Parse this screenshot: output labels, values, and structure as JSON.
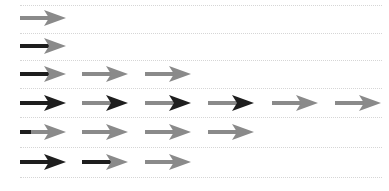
{
  "colors": {
    "dark": "#1e1e1e",
    "gray": "#8a8a8a",
    "rule": "#d6d6d6",
    "background": "#ffffff"
  },
  "rules_y": [
    5,
    33,
    60,
    88,
    117,
    147,
    177
  ],
  "column_x": [
    20,
    82,
    145,
    208,
    272,
    335
  ],
  "rows": [
    {
      "y": 18,
      "arrows": [
        {
          "shaft": "gray",
          "head": "gray"
        }
      ]
    },
    {
      "y": 46,
      "arrows": [
        {
          "shaft": "dark",
          "head": "gray"
        }
      ]
    },
    {
      "y": 74,
      "arrows": [
        {
          "shaft": "dark",
          "head": "gray"
        },
        {
          "shaft": "gray",
          "head": "gray"
        },
        {
          "shaft": "gray",
          "head": "gray"
        }
      ]
    },
    {
      "y": 103,
      "arrows": [
        {
          "shaft": "dark",
          "head": "dark"
        },
        {
          "shaft": "gray",
          "head": "dark"
        },
        {
          "shaft": "gray",
          "head": "dark"
        },
        {
          "shaft": "gray",
          "head": "dark"
        },
        {
          "shaft": "gray",
          "head": "gray"
        },
        {
          "shaft": "gray",
          "head": "gray"
        }
      ]
    },
    {
      "y": 132,
      "arrows": [
        {
          "shaft": "partial-dark",
          "head": "gray"
        },
        {
          "shaft": "gray",
          "head": "gray"
        },
        {
          "shaft": "gray",
          "head": "gray"
        },
        {
          "shaft": "gray",
          "head": "gray"
        }
      ]
    },
    {
      "y": 162,
      "arrows": [
        {
          "shaft": "dark",
          "head": "dark"
        },
        {
          "shaft": "dark",
          "head": "gray"
        },
        {
          "shaft": "gray",
          "head": "gray"
        }
      ]
    }
  ]
}
